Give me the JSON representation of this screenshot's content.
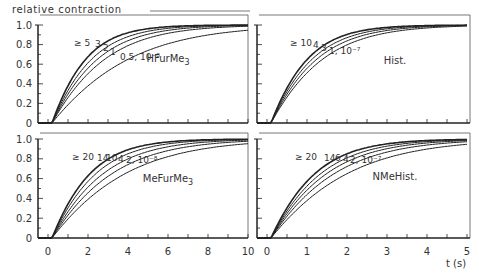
{
  "figure": {
    "ylabel": "relative contraction",
    "xunit_label": "t (s)"
  },
  "chart_data": [
    {
      "type": "line",
      "panel": "top-left",
      "title": "HFurMe3",
      "xlabel": "",
      "ylabel": "relative contraction",
      "xlim": [
        -0.5,
        10
      ],
      "ylim": [
        0,
        1.0
      ],
      "yticks": [
        "0",
        "0.2",
        "0.4",
        "0.6",
        "0.8",
        "1.0"
      ],
      "xticks": [],
      "grid": false,
      "curve_labels": [
        "≥ 5",
        "3",
        "2",
        "1",
        "0.5, 10⁻⁸"
      ],
      "series": [
        {
          "name": "≥ 5",
          "tau": 1.15
        },
        {
          "name": "3",
          "tau": 1.35
        },
        {
          "name": "2",
          "tau": 1.55
        },
        {
          "name": "1",
          "tau": 1.8
        },
        {
          "name": "0.5, 10⁻⁸",
          "tau": 2.6
        }
      ]
    },
    {
      "type": "line",
      "panel": "top-right",
      "title": "Hist.",
      "xlim": [
        -0.25,
        5
      ],
      "ylim": [
        0,
        1.0
      ],
      "grid": false,
      "curve_labels": [
        "≥ 10",
        "4",
        "3",
        "1, 10⁻⁷"
      ],
      "series": [
        {
          "name": "≥ 10",
          "tau": 0.62
        },
        {
          "name": "4",
          "tau": 0.7
        },
        {
          "name": "3",
          "tau": 0.78
        },
        {
          "name": "1, 10⁻⁷",
          "tau": 0.88
        }
      ]
    },
    {
      "type": "line",
      "panel": "bottom-left",
      "title": "MeFurMe3",
      "xlabel": "",
      "xlim": [
        -0.5,
        10
      ],
      "ylim": [
        0,
        1.0
      ],
      "xticks": [
        "0",
        "2",
        "4",
        "6",
        "8",
        "10"
      ],
      "yticks": [
        "0",
        "0.2",
        "0.4",
        "0.6",
        "0.8",
        "1.0"
      ],
      "grid": false,
      "curve_labels": [
        "≥ 20",
        "14",
        "10",
        "4",
        "2, 10⁻⁸"
      ],
      "series": [
        {
          "name": "≥ 20",
          "tau": 1.3
        },
        {
          "name": "14",
          "tau": 1.5
        },
        {
          "name": "10",
          "tau": 1.75
        },
        {
          "name": "4",
          "tau": 2.05
        },
        {
          "name": "2, 10⁻⁸",
          "tau": 2.5
        }
      ]
    },
    {
      "type": "line",
      "panel": "bottom-right",
      "title": "NMeHist.",
      "xlabel": "t (s)",
      "xlim": [
        -0.25,
        5
      ],
      "ylim": [
        0,
        1.0
      ],
      "xticks": [
        "0",
        "1",
        "2",
        "3",
        "4",
        "5"
      ],
      "grid": false,
      "curve_labels": [
        "≥ 20",
        "14",
        "6",
        "4",
        "2, 10⁻⁷"
      ],
      "series": [
        {
          "name": "≥ 20",
          "tau": 0.75
        },
        {
          "name": "14",
          "tau": 0.85
        },
        {
          "name": "6",
          "tau": 0.95
        },
        {
          "name": "4",
          "tau": 1.08
        },
        {
          "name": "2, 10⁻⁷",
          "tau": 1.3
        }
      ]
    }
  ]
}
